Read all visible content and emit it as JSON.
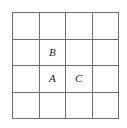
{
  "figure": {
    "type": "grid-diagram",
    "rows": 4,
    "columns": 4,
    "background_color": "#ffffff",
    "grid_line_color": "#6e6e6e",
    "label_color": "#1a1a1a",
    "label_style": "italic-serif"
  },
  "cells": [
    {
      "row": 1,
      "col": 1,
      "label": ""
    },
    {
      "row": 1,
      "col": 2,
      "label": ""
    },
    {
      "row": 1,
      "col": 3,
      "label": ""
    },
    {
      "row": 1,
      "col": 4,
      "label": ""
    },
    {
      "row": 2,
      "col": 1,
      "label": ""
    },
    {
      "row": 2,
      "col": 2,
      "label": "B"
    },
    {
      "row": 2,
      "col": 3,
      "label": ""
    },
    {
      "row": 2,
      "col": 4,
      "label": ""
    },
    {
      "row": 3,
      "col": 1,
      "label": ""
    },
    {
      "row": 3,
      "col": 2,
      "label": "A"
    },
    {
      "row": 3,
      "col": 3,
      "label": "C"
    },
    {
      "row": 3,
      "col": 4,
      "label": ""
    },
    {
      "row": 4,
      "col": 1,
      "label": ""
    },
    {
      "row": 4,
      "col": 2,
      "label": ""
    },
    {
      "row": 4,
      "col": 3,
      "label": ""
    },
    {
      "row": 4,
      "col": 4,
      "label": ""
    }
  ]
}
